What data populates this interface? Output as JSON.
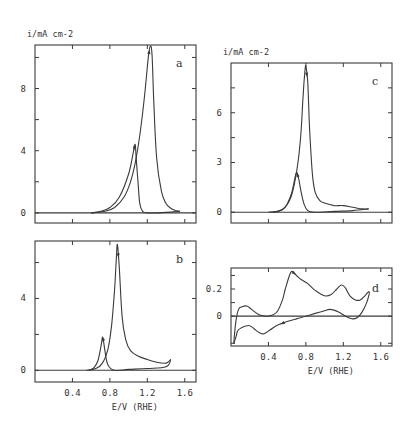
{
  "chart_data": [
    {
      "id": "a",
      "type": "line",
      "panel_label": "a",
      "ylabel": "i/mA cm-2",
      "xlabel": "",
      "xlim": [
        0,
        1.72
      ],
      "ylim": [
        -0.65,
        10.8
      ],
      "yticks": [
        0,
        4,
        8
      ],
      "yminor": [
        2,
        6,
        10
      ],
      "xticks": [
        0.4,
        0.8,
        1.2,
        1.6
      ],
      "show_xtick_labels": false,
      "series": [
        {
          "name": "anodic sweep",
          "x": [
            0.6,
            0.75,
            0.85,
            0.95,
            1.02,
            1.07,
            1.12,
            1.17,
            1.21,
            1.23,
            1.25,
            1.27,
            1.3,
            1.35,
            1.4,
            1.45,
            1.5,
            1.55
          ],
          "y": [
            0,
            0.1,
            0.35,
            1.0,
            2.0,
            3.2,
            5.0,
            7.5,
            10.0,
            10.7,
            10.2,
            7.0,
            3.5,
            1.4,
            0.6,
            0.3,
            0.15,
            0.1
          ]
        },
        {
          "name": "cathodic sweep",
          "x": [
            1.55,
            1.45,
            1.3,
            1.2,
            1.15,
            1.12,
            1.1,
            1.08,
            1.07,
            1.05,
            1.0,
            0.9,
            0.8,
            0.7,
            0.6
          ],
          "y": [
            0.1,
            0.05,
            0.0,
            0.0,
            0.1,
            0.6,
            2.0,
            3.6,
            4.4,
            3.9,
            2.5,
            1.0,
            0.35,
            0.1,
            0.0
          ]
        }
      ]
    },
    {
      "id": "b",
      "type": "line",
      "panel_label": "b",
      "ylabel": "",
      "xlabel": "E/V (RHE)",
      "xlim": [
        0,
        1.72
      ],
      "ylim": [
        -0.65,
        7.2
      ],
      "yticks": [
        0,
        4
      ],
      "yminor": [
        2,
        6
      ],
      "xticks": [
        0.4,
        0.8,
        1.2,
        1.6
      ],
      "xticklabels": [
        "0.4",
        "0.8",
        "1.2",
        "1.6"
      ],
      "show_xtick_labels": true,
      "series": [
        {
          "name": "anodic sweep",
          "x": [
            0.55,
            0.65,
            0.72,
            0.78,
            0.82,
            0.85,
            0.87,
            0.88,
            0.9,
            0.93,
            0.97,
            1.02,
            1.1,
            1.2,
            1.3,
            1.4,
            1.45
          ],
          "y": [
            0,
            0.1,
            0.4,
            1.2,
            2.6,
            4.5,
            6.3,
            7.0,
            5.8,
            3.0,
            1.7,
            1.1,
            0.8,
            0.6,
            0.45,
            0.4,
            0.6
          ]
        },
        {
          "name": "cathodic sweep",
          "x": [
            1.45,
            1.4,
            1.2,
            1.0,
            0.85,
            0.78,
            0.75,
            0.73,
            0.72,
            0.7,
            0.67,
            0.63,
            0.58
          ],
          "y": [
            0.6,
            0.2,
            0.1,
            0.05,
            0.0,
            0.3,
            1.0,
            1.7,
            1.8,
            1.2,
            0.5,
            0.15,
            0.0
          ]
        }
      ]
    },
    {
      "id": "c",
      "type": "line",
      "panel_label": "c",
      "ylabel": "i/mA cm-2",
      "xlabel": "",
      "xlim": [
        0,
        1.72
      ],
      "ylim": [
        -0.65,
        9.0
      ],
      "yticks": [
        0,
        3,
        6
      ],
      "yminor": [
        1.5,
        4.5,
        7.5
      ],
      "xticks": [
        0.4,
        0.8,
        1.2,
        1.6
      ],
      "show_xtick_labels": false,
      "series": [
        {
          "name": "anodic sweep",
          "x": [
            0.4,
            0.5,
            0.58,
            0.64,
            0.68,
            0.72,
            0.75,
            0.77,
            0.79,
            0.8,
            0.82,
            0.84,
            0.87,
            0.9,
            0.95,
            1.0,
            1.1,
            1.2,
            1.3,
            1.4,
            1.47
          ],
          "y": [
            0,
            0.05,
            0.3,
            0.9,
            1.8,
            3.2,
            5.0,
            7.0,
            8.5,
            8.8,
            7.8,
            5.0,
            2.3,
            1.2,
            0.7,
            0.55,
            0.4,
            0.4,
            0.3,
            0.2,
            0.2
          ]
        },
        {
          "name": "cathodic sweep",
          "x": [
            1.47,
            1.3,
            1.1,
            0.9,
            0.82,
            0.78,
            0.75,
            0.72,
            0.7,
            0.68,
            0.65,
            0.6,
            0.55,
            0.45
          ],
          "y": [
            0.2,
            0.1,
            0.05,
            0.0,
            0.1,
            0.5,
            1.2,
            2.1,
            2.4,
            2.0,
            1.2,
            0.5,
            0.15,
            0.0
          ]
        }
      ]
    },
    {
      "id": "d",
      "type": "line",
      "panel_label": "d",
      "ylabel": "",
      "xlabel": "E/V (RHE)",
      "xlim": [
        0,
        1.72
      ],
      "ylim": [
        -0.22,
        0.355
      ],
      "yticks": [
        0,
        0.2
      ],
      "yticklabels": [
        "0",
        "0.2"
      ],
      "yminor": [
        -0.2,
        0.1,
        0.3
      ],
      "xticks": [
        0.4,
        0.8,
        1.2,
        1.6
      ],
      "xticklabels": [
        "0.4",
        "0.8",
        "1.2",
        "1.6"
      ],
      "show_xtick_labels": true,
      "series": [
        {
          "name": "anodic sweep",
          "x": [
            0.03,
            0.05,
            0.08,
            0.12,
            0.17,
            0.22,
            0.3,
            0.38,
            0.45,
            0.5,
            0.55,
            0.58,
            0.62,
            0.65,
            0.7,
            0.75,
            0.82,
            0.9,
            1.0,
            1.07,
            1.13,
            1.18,
            1.22,
            1.27,
            1.33,
            1.38,
            1.43,
            1.47,
            1.48
          ],
          "y": [
            -0.2,
            -0.05,
            0.05,
            0.07,
            0.075,
            0.05,
            0.01,
            0.0,
            0.01,
            0.04,
            0.12,
            0.2,
            0.29,
            0.33,
            0.3,
            0.27,
            0.24,
            0.19,
            0.15,
            0.16,
            0.2,
            0.23,
            0.21,
            0.15,
            0.12,
            0.12,
            0.15,
            0.18,
            0.17
          ]
        },
        {
          "name": "cathodic sweep",
          "x": [
            1.48,
            1.45,
            1.4,
            1.35,
            1.3,
            1.25,
            1.2,
            1.15,
            1.1,
            1.05,
            1.0,
            0.9,
            0.8,
            0.7,
            0.6,
            0.5,
            0.42,
            0.35,
            0.3,
            0.25,
            0.2,
            0.15,
            0.1,
            0.07,
            0.05,
            0.03
          ],
          "y": [
            0.17,
            0.1,
            0.03,
            -0.01,
            -0.02,
            -0.01,
            0.01,
            0.03,
            0.045,
            0.05,
            0.04,
            0.02,
            0.0,
            -0.02,
            -0.04,
            -0.065,
            -0.1,
            -0.13,
            -0.12,
            -0.095,
            -0.07,
            -0.075,
            -0.09,
            -0.11,
            -0.16,
            -0.2
          ]
        }
      ]
    }
  ]
}
